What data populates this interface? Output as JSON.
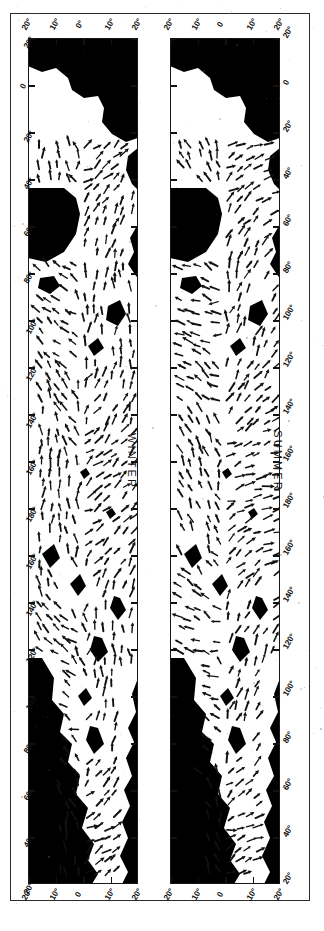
{
  "figure": {
    "kind": "scanned-scientific-figure",
    "orientation": "maps rotated 90 degrees on the page",
    "frame_color": "#2b2b2b",
    "land_color": "#000000",
    "ocean_color": "#ffffff",
    "arrow_color": "#111111"
  },
  "panels": [
    {
      "id": "winter",
      "title": "WINTER",
      "latitude_axis": {
        "label_top": [
          "20°",
          "10°",
          "0°",
          "10°",
          "20°"
        ],
        "label_bottom": [
          "20°",
          "10°",
          "0",
          "10°",
          "20°"
        ],
        "values": [
          20,
          10,
          0,
          -10,
          -20
        ],
        "units": "degrees"
      },
      "longitude_axis": {
        "side": "left",
        "labels": [
          "20°",
          "0",
          "20°",
          "40°",
          "60°",
          "80°",
          "100°",
          "120°",
          "140°",
          "160°",
          "180°",
          "160°",
          "140°",
          "120°",
          "100°",
          "80°",
          "60°",
          "40°",
          "20°"
        ],
        "values": [
          -20,
          0,
          20,
          40,
          60,
          80,
          100,
          120,
          140,
          160,
          180,
          -160,
          -140,
          -120,
          -100,
          -80,
          -60,
          -40,
          -20
        ],
        "units": "degrees"
      }
    },
    {
      "id": "summer",
      "title": "SUMMER",
      "latitude_axis": {
        "label_top": [
          "20°",
          "10°",
          "0",
          "10°",
          "20°"
        ],
        "label_bottom": [
          "20°",
          "10°",
          "0",
          "10°",
          "20°"
        ],
        "values": [
          20,
          10,
          0,
          -10,
          -20
        ],
        "units": "degrees"
      },
      "longitude_axis": {
        "side": "right",
        "labels": [
          "20°",
          "0",
          "20°",
          "40°",
          "60°",
          "80°",
          "100°",
          "120°",
          "140°",
          "160°",
          "180°",
          "160°",
          "140°",
          "120°",
          "100°",
          "80°",
          "60°",
          "40°",
          "20°"
        ],
        "values": [
          -20,
          0,
          20,
          40,
          60,
          80,
          100,
          120,
          140,
          160,
          180,
          -160,
          -140,
          -120,
          -100,
          -80,
          -60,
          -40,
          -20
        ],
        "units": "degrees"
      }
    }
  ],
  "chart_data": {
    "type": "scatter",
    "title": "",
    "xlabel": "Longitude",
    "ylabel": "Latitude",
    "xlim": [
      -20,
      340
    ],
    "ylim": [
      -20,
      20
    ],
    "grid": false,
    "legend": "none",
    "series": [
      {
        "name": "WINTER vector field",
        "note": "arrows over ocean, tropics 20N-20S"
      },
      {
        "name": "SUMMER vector field",
        "note": "arrows over ocean, tropics 20N-20S"
      }
    ]
  }
}
